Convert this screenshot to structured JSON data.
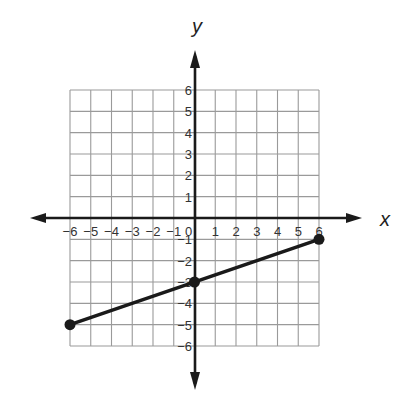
{
  "chart_data": {
    "type": "line",
    "title": "",
    "xlabel": "x",
    "ylabel": "y",
    "xlim": [
      -6,
      6
    ],
    "ylim": [
      -6,
      6
    ],
    "grid": true,
    "x_ticks": [
      -6,
      -5,
      -4,
      -3,
      -2,
      -1,
      0,
      1,
      2,
      3,
      4,
      5,
      6
    ],
    "y_ticks": [
      -6,
      -5,
      -4,
      -3,
      -2,
      -1,
      1,
      2,
      3,
      4,
      5,
      6
    ],
    "x_tick_labels": [
      "−6",
      "−5",
      "−4",
      "−3",
      "−2",
      "−1",
      "0",
      "1",
      "2",
      "3",
      "4",
      "5",
      "6"
    ],
    "y_tick_labels": [
      "−6",
      "−5",
      "−4",
      "−3",
      "−2",
      "−1",
      "1",
      "2",
      "3",
      "4",
      "5",
      "6"
    ],
    "series": [
      {
        "name": "line segment",
        "x": [
          -6,
          0,
          6
        ],
        "y": [
          -5,
          -3,
          -1
        ],
        "points_marked": [
          [
            -6,
            -5
          ],
          [
            0,
            -3
          ],
          [
            6,
            -1
          ]
        ]
      }
    ],
    "colors": {
      "grid": "#9a9a9a",
      "axis": "#1a1a1a",
      "line": "#1a1a1a"
    }
  }
}
